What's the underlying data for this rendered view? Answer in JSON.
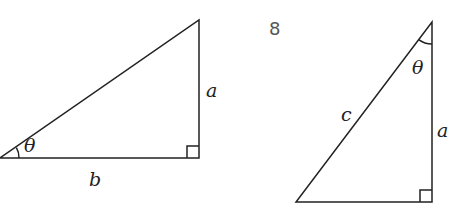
{
  "figure": {
    "problem_number": "8",
    "colors": {
      "line": "#222222",
      "number": "#555555",
      "background": "#ffffff"
    }
  },
  "left_triangle": {
    "labels": {
      "opposite": "a",
      "adjacent": "b",
      "angle": "θ"
    },
    "vertices": {
      "angle_vertex": [
        0,
        158
      ],
      "right_angle_vertex": [
        199,
        158
      ],
      "top_vertex": [
        199,
        20
      ]
    }
  },
  "right_triangle": {
    "labels": {
      "hypotenuse": "c",
      "adjacent": "a",
      "angle": "θ"
    },
    "vertices": {
      "bottom_left": [
        296,
        202
      ],
      "right_angle_vertex": [
        432,
        202
      ],
      "angle_vertex": [
        432,
        22
      ]
    }
  }
}
